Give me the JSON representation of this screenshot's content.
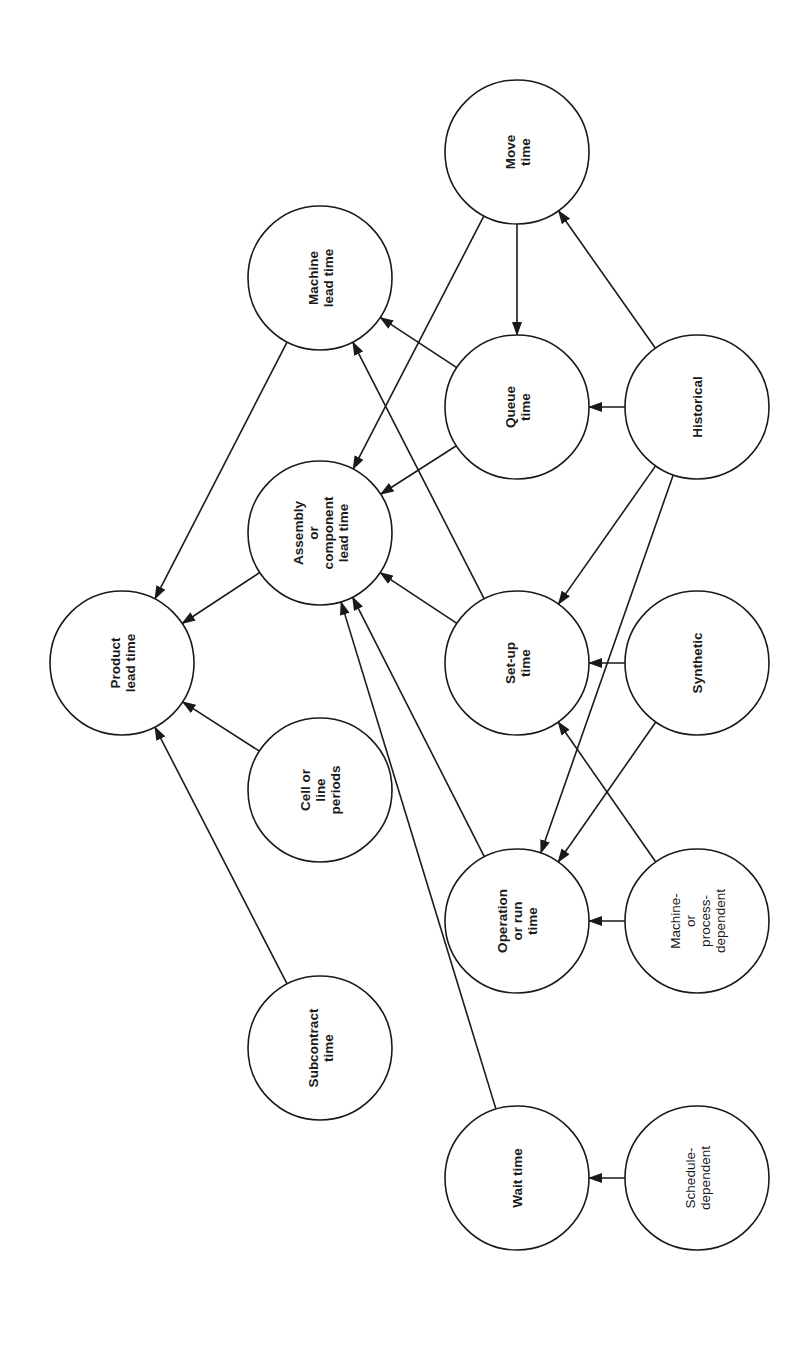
{
  "diagram": {
    "type": "directed-graph",
    "orientation": "rotated-90-ccw",
    "node_radius": 72,
    "colors": {
      "stroke": "#1a1a1a",
      "fill": "#ffffff",
      "background": "#ffffff"
    },
    "nodes": [
      {
        "id": "product",
        "lines": [
          "Product",
          "lead time"
        ],
        "x": 122,
        "y": 663,
        "bold": true
      },
      {
        "id": "machine_lt",
        "lines": [
          "Machine",
          "lead time"
        ],
        "x": 320,
        "y": 278,
        "bold": true
      },
      {
        "id": "assembly",
        "lines": [
          "Assembly",
          "or",
          "component",
          "lead time"
        ],
        "x": 320,
        "y": 533,
        "bold": true
      },
      {
        "id": "cell",
        "lines": [
          "Cell or",
          "line",
          "periods"
        ],
        "x": 320,
        "y": 790,
        "bold": true
      },
      {
        "id": "subcontract",
        "lines": [
          "Subcontract",
          "time"
        ],
        "x": 320,
        "y": 1048,
        "bold": true
      },
      {
        "id": "move",
        "lines": [
          "Move",
          "time"
        ],
        "x": 517,
        "y": 152,
        "bold": true
      },
      {
        "id": "queue",
        "lines": [
          "Queue",
          "time"
        ],
        "x": 517,
        "y": 407,
        "bold": true
      },
      {
        "id": "setup",
        "lines": [
          "Set-up",
          "time"
        ],
        "x": 517,
        "y": 663,
        "bold": true
      },
      {
        "id": "operation",
        "lines": [
          "Operation",
          "or run",
          "time"
        ],
        "x": 517,
        "y": 921,
        "bold": true
      },
      {
        "id": "wait",
        "lines": [
          "Wait time"
        ],
        "x": 517,
        "y": 1178,
        "bold": true
      },
      {
        "id": "historical",
        "lines": [
          "Historical"
        ],
        "x": 697,
        "y": 407,
        "bold": true
      },
      {
        "id": "synthetic",
        "lines": [
          "Synthetic"
        ],
        "x": 697,
        "y": 663,
        "bold": true
      },
      {
        "id": "machine_dep",
        "lines": [
          "Machine-",
          "or",
          "process-",
          "dependent"
        ],
        "x": 697,
        "y": 921,
        "bold": false
      },
      {
        "id": "schedule",
        "lines": [
          "Schedule-",
          "dependent"
        ],
        "x": 697,
        "y": 1178,
        "bold": false
      }
    ],
    "edges": [
      {
        "from": "machine_lt",
        "to": "product"
      },
      {
        "from": "assembly",
        "to": "product"
      },
      {
        "from": "cell",
        "to": "product"
      },
      {
        "from": "subcontract",
        "to": "product"
      },
      {
        "from": "queue",
        "to": "machine_lt"
      },
      {
        "from": "setup",
        "to": "machine_lt"
      },
      {
        "from": "move",
        "to": "assembly"
      },
      {
        "from": "queue",
        "to": "assembly"
      },
      {
        "from": "setup",
        "to": "assembly"
      },
      {
        "from": "operation",
        "to": "assembly"
      },
      {
        "from": "wait",
        "to": "assembly"
      },
      {
        "from": "move",
        "to": "queue"
      },
      {
        "from": "historical",
        "to": "move"
      },
      {
        "from": "historical",
        "to": "queue"
      },
      {
        "from": "historical",
        "to": "setup"
      },
      {
        "from": "historical",
        "to": "operation"
      },
      {
        "from": "synthetic",
        "to": "setup"
      },
      {
        "from": "synthetic",
        "to": "operation"
      },
      {
        "from": "machine_dep",
        "to": "operation"
      },
      {
        "from": "machine_dep",
        "to": "setup"
      },
      {
        "from": "schedule",
        "to": "wait"
      }
    ]
  }
}
